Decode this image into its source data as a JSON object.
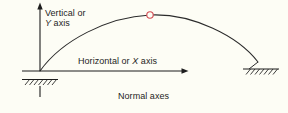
{
  "figure": {
    "caption": "Normal axes",
    "background_color": "#fdfdf5",
    "ink_color": "#1d1d1d",
    "marker_color": "#d24a52",
    "labels": {
      "vertical_axis_line1": "Vertical or",
      "vertical_axis_letter": "Y",
      "vertical_axis_line2_suffix": " axis",
      "horizontal_axis_prefix": "Horizontal or ",
      "horizontal_axis_letter": "X",
      "horizontal_axis_suffix": " axis"
    },
    "icons": {
      "y_axis_arrow": "arrow-up-icon",
      "x_axis_arrow": "arrow-right-icon",
      "crown_marker": "crown-point-circle-icon",
      "left_support": "fixed-support-hatch-icon",
      "right_support": "fixed-support-hatch-icon"
    },
    "geometry": {
      "origin": [
        40,
        71
      ],
      "y_axis_top": [
        40,
        4
      ],
      "x_axis_end": [
        188,
        71
      ],
      "arch_left_springing": [
        40,
        71
      ],
      "arch_crown": [
        150,
        15
      ],
      "arch_right_springing": [
        258,
        62
      ],
      "crown_marker_radius": 3.2
    }
  }
}
